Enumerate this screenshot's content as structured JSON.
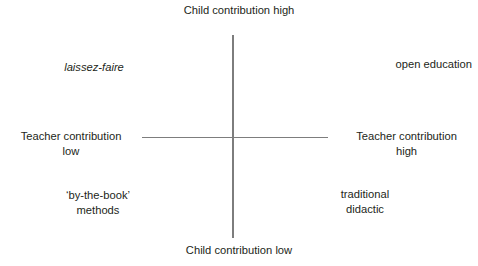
{
  "diagram": {
    "type": "quadrant-diagram",
    "axes": {
      "vertical": {
        "top_label": "Child contribution high",
        "bottom_label": "Child contribution low"
      },
      "horizontal": {
        "left_label": "Teacher contribution\nlow",
        "right_label": "Teacher contribution\nhigh"
      },
      "line_color": "#7d7d7d"
    },
    "quadrants": {
      "top_left": "laissez-faire",
      "top_right": "open education",
      "bottom_left": "‘by-the-book’\nmethods",
      "bottom_right": "traditional\ndidactic"
    },
    "text_color": "#231f20",
    "background_color": "#ffffff"
  }
}
